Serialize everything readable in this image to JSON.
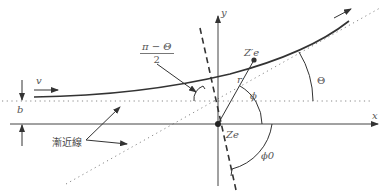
{
  "diagram": {
    "type": "Rutherford scattering geometry",
    "colors": {
      "line": "#333333",
      "dotted": "#888888",
      "label": "#555555",
      "background": "#ffffff"
    },
    "labels": {
      "y_axis": "y",
      "x_axis": "x",
      "velocity": "v",
      "impact_parameter": "b",
      "asymptote": "漸近線",
      "angle_fraction_numerator": "π − Θ",
      "angle_fraction_denominator": "2",
      "particle": "Z′e",
      "nucleus": "Ze",
      "radius": "r",
      "phi": "ϕ",
      "phi0": "ϕ0",
      "scattering_angle": "Θ"
    }
  }
}
